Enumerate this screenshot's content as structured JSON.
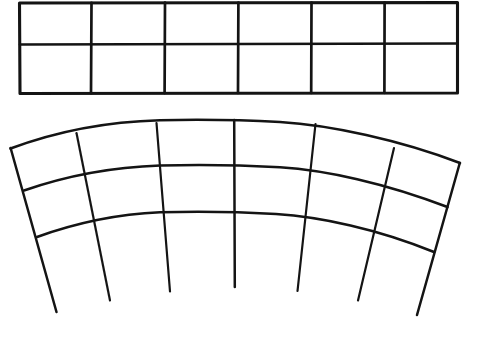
{
  "document": {
    "kind": "geometry-line-drawing",
    "background_color": "#ffffff",
    "ink_color": "#141414",
    "width": 479,
    "height": 340,
    "caption": ""
  },
  "figures": [
    {
      "id": "straight-grid",
      "name": "rectangular-strip-grid",
      "description": "Flat rectangular strip divided into 6 columns and 2 rows",
      "columns": 6,
      "rows": 2,
      "bounds": {
        "x": 19,
        "y": 2,
        "width": 439,
        "height": 92
      },
      "column_x": [
        19,
        91,
        165,
        238,
        311,
        384,
        458
      ],
      "row_y": [
        2,
        44,
        93
      ]
    },
    {
      "id": "curved-grid",
      "name": "annular-fan-grid",
      "description": "Curved annulus sector divided into 6 sectors and 3 bands, radial lines overshoot past the inner arc",
      "sectors": 6,
      "bands": 3,
      "center": {
        "x": 236,
        "y": 536
      },
      "radii": [
        416,
        371,
        324
      ],
      "overshoot_radius": 250,
      "angle_start_deg": 211.5,
      "angle_end_deg": 328.5,
      "apex": {
        "x": 234,
        "y": 120
      },
      "left_tip": {
        "x": 10,
        "y": 148
      },
      "right_tip": {
        "x": 460,
        "y": 163
      }
    }
  ],
  "chart_data": {
    "type": "table",
    "title": "",
    "xlabel": "",
    "ylabel": "",
    "series": [
      {
        "name": "rectangular-strip-grid",
        "cells": 12,
        "columns": 6,
        "rows": 2,
        "cell_width_px": 73,
        "cell_height_px": 46
      },
      {
        "name": "annular-fan-grid",
        "cells": 18,
        "sectors": 6,
        "bands": 3,
        "sector_angle_deg": 19.5,
        "band_thickness_px": 46
      }
    ],
    "grid": true,
    "legend_position": "none"
  }
}
